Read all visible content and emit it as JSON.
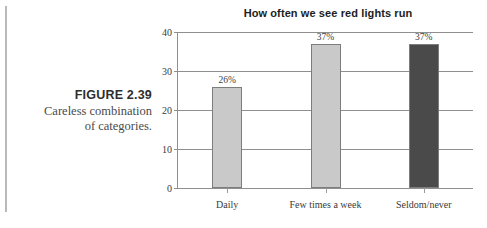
{
  "figure": {
    "label": "FIGURE 2.39",
    "description_line1": "Careless combination",
    "description_line2": "of categories."
  },
  "chart_data": {
    "type": "bar",
    "title": "How often we see red lights run",
    "xlabel": "",
    "ylabel": "",
    "categories": [
      "Daily",
      "Few times a week",
      "Seldom/never"
    ],
    "values": [
      26,
      37,
      37
    ],
    "data_labels": [
      "26%",
      "37%",
      "37%"
    ],
    "bar_colors": [
      "#c9c9c9",
      "#c9c9c9",
      "#4a4a4a"
    ],
    "bar_border_color": "#7d7d7d",
    "ylim": [
      0,
      40
    ],
    "yticks": [
      0,
      10,
      20,
      30,
      40
    ],
    "ytick_labels": [
      "0",
      "10",
      "20",
      "30",
      "40"
    ],
    "grid": true,
    "gridline_color": "#8f8f8f",
    "legend": "none"
  }
}
